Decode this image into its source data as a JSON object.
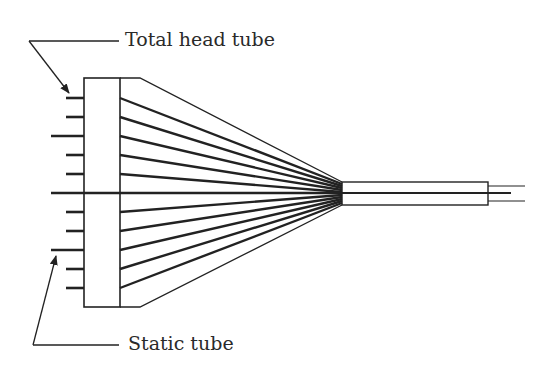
{
  "diagram": {
    "labels": {
      "total_head": "Total head tube",
      "static": "Static tube"
    },
    "colors": {
      "stroke": "#222222",
      "background": "#ffffff"
    },
    "manifold": {
      "outer_left_x": 84,
      "inner_x": 120,
      "top_y": 78,
      "bottom_y": 307,
      "taper_start_x": 140
    },
    "tube": {
      "left_x": 342,
      "right_x": 488,
      "top_y": 182,
      "bottom_y": 205,
      "center_exit_x": 511,
      "thin_exit_x": 525,
      "thin_upper_y": 186,
      "thin_lower_y": 201
    },
    "stubs": [
      {
        "y": 98,
        "type": "total",
        "x_start": 66
      },
      {
        "y": 117,
        "type": "total",
        "x_start": 66
      },
      {
        "y": 136,
        "type": "static",
        "x_start": 51
      },
      {
        "y": 155,
        "type": "total",
        "x_start": 66
      },
      {
        "y": 174,
        "type": "total",
        "x_start": 66
      },
      {
        "y": 193,
        "type": "center",
        "x_start": 51
      },
      {
        "y": 212,
        "type": "total",
        "x_start": 66
      },
      {
        "y": 231,
        "type": "total",
        "x_start": 66
      },
      {
        "y": 250,
        "type": "static",
        "x_start": 51
      },
      {
        "y": 269,
        "type": "total",
        "x_start": 66
      },
      {
        "y": 288,
        "type": "total",
        "x_start": 66
      }
    ],
    "fan_end_y": [
      184,
      186,
      188,
      190,
      192,
      193,
      195,
      197,
      199,
      201,
      203
    ]
  }
}
